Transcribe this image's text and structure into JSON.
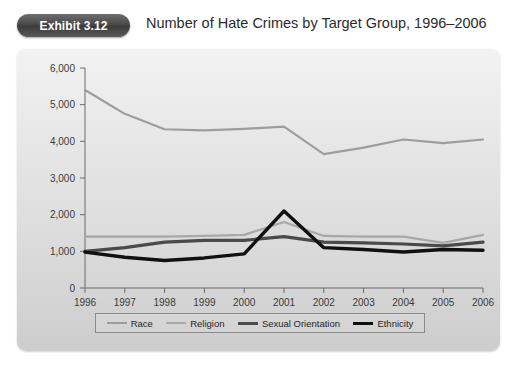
{
  "header": {
    "badge_label": "Exhibit 3.12",
    "title": "Number of Hate Crimes by Target Group, 1996–2006"
  },
  "colors": {
    "race": "#9d9d9d",
    "religion": "#a8a8a8",
    "sexual_orientation": "#4a4a4a",
    "ethnicity": "#101010",
    "axis": "#6b6b6b",
    "panel_bg": "#e4e4e4",
    "badge_bg": "#4a4a4a"
  },
  "legend": {
    "items": [
      {
        "label": "Race",
        "color": "#9d9d9d",
        "width": 2.2
      },
      {
        "label": "Religion",
        "color": "#a8a8a8",
        "width": 2.2
      },
      {
        "label": "Sexual Orientation",
        "color": "#4a4a4a",
        "width": 3.2
      },
      {
        "label": "Ethnicity",
        "color": "#101010",
        "width": 3.4
      }
    ]
  },
  "axes": {
    "y_ticks": [
      "0",
      "1,000",
      "2,000",
      "3,000",
      "4,000",
      "5,000",
      "6,000"
    ],
    "x_ticks": [
      "1996",
      "1997",
      "1998",
      "1999",
      "2000",
      "2001",
      "2002",
      "2003",
      "2004",
      "2005",
      "2006"
    ]
  },
  "chart_data": {
    "type": "line",
    "title": "Number of Hate Crimes by Target Group, 1996–2006",
    "xlabel": "",
    "ylabel": "",
    "x": [
      1996,
      1997,
      1998,
      1999,
      2000,
      2001,
      2002,
      2003,
      2004,
      2005,
      2006
    ],
    "categories": [
      "1996",
      "1997",
      "1998",
      "1999",
      "2000",
      "2001",
      "2002",
      "2003",
      "2004",
      "2005",
      "2006"
    ],
    "ylim": [
      0,
      6000
    ],
    "ytick_step": 1000,
    "grid": false,
    "legend_position": "bottom",
    "series": [
      {
        "name": "Race",
        "color": "#9d9d9d",
        "values": [
          5400,
          4750,
          4330,
          4300,
          4340,
          4400,
          3650,
          3830,
          4050,
          3950,
          4050
        ]
      },
      {
        "name": "Religion",
        "color": "#a8a8a8",
        "values": [
          1400,
          1400,
          1400,
          1420,
          1450,
          1800,
          1420,
          1400,
          1400,
          1230,
          1450
        ]
      },
      {
        "name": "Sexual Orientation",
        "color": "#4a4a4a",
        "values": [
          1000,
          1100,
          1250,
          1300,
          1300,
          1400,
          1250,
          1230,
          1200,
          1150,
          1250
        ]
      },
      {
        "name": "Ethnicity",
        "color": "#101010",
        "values": [
          980,
          840,
          750,
          820,
          930,
          2100,
          1100,
          1050,
          980,
          1050,
          1030
        ]
      }
    ]
  }
}
